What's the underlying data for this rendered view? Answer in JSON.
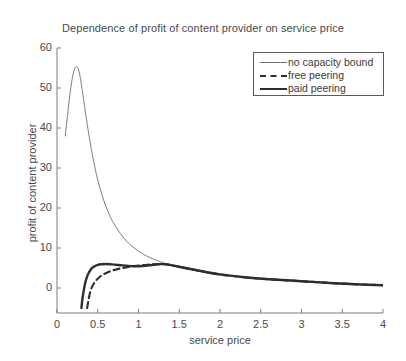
{
  "chart_data": {
    "type": "line",
    "title": "Dependence of profit of content provider on service price",
    "xlabel": "service price",
    "ylabel": "profit of content provider",
    "xlim": [
      0,
      4
    ],
    "ylim": [
      -5,
      60
    ],
    "xticks": [
      "0",
      "0.5",
      "1",
      "1.5",
      "2",
      "2.5",
      "3",
      "3.5",
      "4"
    ],
    "xtick_values": [
      0,
      0.5,
      1,
      1.5,
      2,
      2.5,
      3,
      3.5,
      4
    ],
    "yticks": [
      "0",
      "10",
      "20",
      "30",
      "40",
      "50",
      "60"
    ],
    "ytick_values": [
      0,
      10,
      20,
      30,
      40,
      50,
      60
    ],
    "grid": false,
    "legend_position": "upper right",
    "series": [
      {
        "name": "no capacity bound",
        "style": "thin-solid",
        "color": "#6e6e6e",
        "x": [
          0.1,
          0.12,
          0.14,
          0.16,
          0.18,
          0.2,
          0.22,
          0.24,
          0.25,
          0.26,
          0.28,
          0.3,
          0.33,
          0.36,
          0.4,
          0.45,
          0.5,
          0.55,
          0.6,
          0.65,
          0.7,
          0.8,
          0.9,
          1.0,
          1.1,
          1.2,
          1.25,
          1.35,
          1.5,
          1.7,
          2.0,
          2.3,
          2.6,
          3.0,
          3.4,
          3.7,
          4.0
        ],
        "y": [
          38.0,
          41.5,
          45.2,
          48.6,
          51.5,
          53.7,
          55.0,
          55.3,
          55.2,
          54.8,
          53.2,
          50.8,
          46.6,
          42.4,
          37.2,
          31.6,
          27.0,
          23.4,
          20.4,
          18.0,
          16.0,
          13.0,
          10.8,
          9.2,
          8.0,
          7.1,
          6.7,
          6.0,
          5.2,
          4.4,
          3.4,
          2.7,
          2.2,
          1.7,
          1.2,
          0.9,
          0.7
        ]
      },
      {
        "name": "free peering",
        "style": "dashed",
        "color": "#2e2e2e",
        "x": [
          0.37,
          0.39,
          0.41,
          0.44,
          0.48,
          0.52,
          0.57,
          0.63,
          0.7,
          0.78,
          0.86,
          0.95,
          1.05,
          1.15,
          1.25,
          1.35,
          1.5,
          1.7,
          2.0,
          2.3,
          2.6,
          3.0,
          3.4,
          3.7,
          4.0
        ],
        "y": [
          -5.0,
          -2.6,
          -0.8,
          0.7,
          1.9,
          2.7,
          3.4,
          4.0,
          4.5,
          4.9,
          5.2,
          5.5,
          5.7,
          5.9,
          6.0,
          5.9,
          5.3,
          4.5,
          3.4,
          2.7,
          2.2,
          1.7,
          1.2,
          0.9,
          0.7
        ]
      },
      {
        "name": "paid peering",
        "style": "thick-solid",
        "color": "#2e2e2e",
        "x": [
          0.3,
          0.31,
          0.33,
          0.35,
          0.38,
          0.41,
          0.45,
          0.5,
          0.55,
          0.6,
          0.65,
          0.7,
          0.78,
          0.86,
          0.95,
          1.05,
          1.15,
          1.25,
          1.35,
          1.5,
          1.7,
          2.0,
          2.3,
          2.6,
          3.0,
          3.4,
          3.7,
          4.0
        ],
        "y": [
          -5.0,
          -3.0,
          -0.4,
          1.6,
          3.4,
          4.5,
          5.3,
          5.8,
          5.95,
          6.0,
          5.95,
          5.85,
          5.7,
          5.55,
          5.45,
          5.5,
          5.7,
          5.95,
          5.9,
          5.3,
          4.5,
          3.4,
          2.7,
          2.2,
          1.7,
          1.2,
          0.9,
          0.7
        ]
      }
    ],
    "legend": [
      {
        "label": "no capacity bound",
        "style": "thin-solid"
      },
      {
        "label": "free peering",
        "style": "dashed"
      },
      {
        "label": "paid peering",
        "style": "thick-solid"
      }
    ],
    "colors": {
      "axis": "#7a7a7a",
      "text": "#3a3a3a",
      "thin_line": "#6e6e6e",
      "bold_line": "#2e2e2e",
      "background": "#ffffff"
    }
  }
}
